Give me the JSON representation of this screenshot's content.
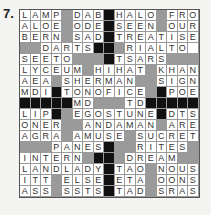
{
  "puzzle_number": "7.",
  "grid": {
    "cols": 17,
    "rows": 17,
    "legend": {
      "letter": "white cell",
      "#": "shaded cell",
      "@": "black cell"
    },
    "rows_data": [
      "LAMP#DAB@HALO#FRO",
      "ALOE#ODE@SEEN#OUR",
      "BERN#SAD@TREATISE",
      "##DARTS@@#RIALTO ",
      "SEETO###@TSARS###",
      "LYCEUM#HIHAT#KHAN",
      "AEA#SHERMAN##SIGN",
      "MDI@TONOFICE#@POE",
      "@@@@@MD###TD@@@@@",
      "LIP@#EGOSTUNE@DTS",
      "ONER##ANDAMAN#ARE",
      "AGRA#AMUSE#SUCRET",
      "###PANES@##RITES#",
      "INTERN#@@#DREAM##",
      "LANDLADY@TAO#NOUS",
      "ITT#ELSE@ETA#OONS",
      "ASS#SSTS@TAD#SRAS"
    ]
  },
  "colors": {
    "white": "#ffffff",
    "shaded": "#9a9a9a",
    "black": "#111111",
    "border": "#555555"
  }
}
